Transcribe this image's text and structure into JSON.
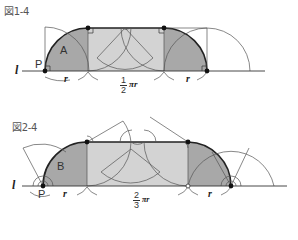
{
  "figures": [
    {
      "title": "図1-4",
      "region_label": "A",
      "point_label": "P",
      "line_label": "l",
      "radius_label_left": "r",
      "radius_label_right": "r",
      "arc_length_label": {
        "numerator": "1",
        "denominator": "2",
        "suffix": "πr"
      }
    },
    {
      "title": "図2-4",
      "region_label": "B",
      "point_label": "P",
      "line_label": "l",
      "radius_label": "r",
      "arc_length_label": {
        "numerator": "2",
        "denominator": "3",
        "suffix": "πr"
      }
    }
  ],
  "colors": {
    "dark_fill": "#a9a9a9",
    "light_fill": "#d0d0d0",
    "line": "#333333",
    "thin_line": "#555555",
    "text": "#444444"
  }
}
